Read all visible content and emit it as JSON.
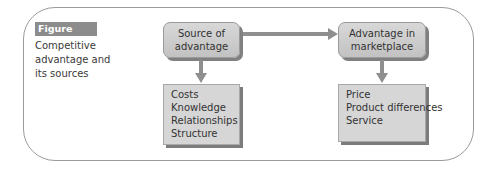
{
  "figure": {
    "label": "Figure 22.4",
    "caption_lines": [
      "Competitive",
      "advantage and",
      "its sources"
    ]
  },
  "nodes": {
    "source": {
      "lines": [
        "Source of",
        "advantage"
      ],
      "items": [
        "Costs",
        "Knowledge",
        "Relationships",
        "Structure"
      ]
    },
    "market": {
      "lines": [
        "Advantage in",
        "marketplace"
      ],
      "items": [
        "Price",
        "Product differences",
        "Service"
      ]
    }
  },
  "edges": [
    {
      "from": "Source of advantage",
      "to": "Advantage in marketplace"
    },
    {
      "from": "Source of advantage",
      "to": "source list"
    },
    {
      "from": "Advantage in marketplace",
      "to": "market list"
    }
  ],
  "colors": {
    "label_bg": "#8c8c8c",
    "box_fill": "#cfcfcf",
    "arrow": "#8f8f8f",
    "frame": "#9a9a9a"
  }
}
